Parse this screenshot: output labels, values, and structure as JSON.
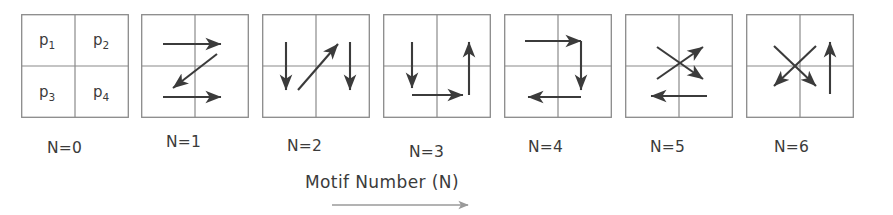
{
  "figure": {
    "caption": "Motif  Number (N)",
    "caption_arrow_icon": "right-arrow-icon",
    "background_color": "#ffffff",
    "ink_color": "#3b3b3b",
    "grid_line_color": "#8a8a8a",
    "caption_arrow_color": "#9a9a9a"
  },
  "motifs": [
    {
      "label": "N=0",
      "x": 21,
      "label_x": 47,
      "label_y": 9,
      "type": "quadrant-labels",
      "quadrant_labels": [
        {
          "base": "p",
          "sub": "1"
        },
        {
          "base": "p",
          "sub": "2"
        },
        {
          "base": "p",
          "sub": "3"
        },
        {
          "base": "p",
          "sub": "4"
        }
      ],
      "arrows": []
    },
    {
      "label": "N=1",
      "x": 141,
      "label_x": 166,
      "label_y": 3,
      "type": "arrows",
      "arrows": [
        {
          "name": "top-right-arrow",
          "direction": "right",
          "x1": 22,
          "y1": 30,
          "x2": 80,
          "y2": 30
        },
        {
          "name": "diagonal-down-left-arrow",
          "direction": "down-left",
          "x1": 76,
          "y1": 40,
          "x2": 32,
          "y2": 74
        },
        {
          "name": "bottom-right-arrow",
          "direction": "right",
          "x1": 22,
          "y1": 83,
          "x2": 80,
          "y2": 83
        }
      ]
    },
    {
      "label": "N=2",
      "x": 262,
      "label_x": 287,
      "label_y": 7,
      "type": "arrows",
      "arrows": [
        {
          "name": "left-down-arrow",
          "direction": "down",
          "x1": 24,
          "y1": 28,
          "x2": 24,
          "y2": 76
        },
        {
          "name": "diagonal-up-right-arrow",
          "direction": "up-right",
          "x1": 36,
          "y1": 76,
          "x2": 76,
          "y2": 30
        },
        {
          "name": "right-down-arrow",
          "direction": "down",
          "x1": 88,
          "y1": 28,
          "x2": 88,
          "y2": 76
        }
      ]
    },
    {
      "label": "N=3",
      "x": 383,
      "label_x": 409,
      "label_y": 13,
      "type": "arrows",
      "arrows": [
        {
          "name": "left-down-arrow",
          "direction": "down",
          "x1": 29,
          "y1": 28,
          "x2": 29,
          "y2": 74
        },
        {
          "name": "bottom-right-arrow",
          "direction": "right",
          "x1": 29,
          "y1": 81,
          "x2": 80,
          "y2": 81
        },
        {
          "name": "right-up-arrow",
          "direction": "up",
          "x1": 86,
          "y1": 81,
          "x2": 86,
          "y2": 28
        }
      ]
    },
    {
      "label": "N=4",
      "x": 504,
      "label_x": 528,
      "label_y": 8,
      "type": "arrows",
      "arrows": [
        {
          "name": "top-right-arrow",
          "direction": "right",
          "x1": 21,
          "y1": 27,
          "x2": 77,
          "y2": 27
        },
        {
          "name": "right-down-arrow",
          "direction": "down",
          "x1": 77,
          "y1": 27,
          "x2": 77,
          "y2": 76
        },
        {
          "name": "bottom-left-arrow",
          "direction": "left",
          "x1": 77,
          "y1": 83,
          "x2": 24,
          "y2": 83
        }
      ]
    },
    {
      "label": "N=5",
      "x": 625,
      "label_x": 650,
      "label_y": 8,
      "type": "arrows",
      "arrows": [
        {
          "name": "diagonal-up-right-arrow",
          "direction": "up-right",
          "x1": 32,
          "y1": 65,
          "x2": 78,
          "y2": 33
        },
        {
          "name": "diagonal-down-right-arrow",
          "direction": "down-right",
          "x1": 32,
          "y1": 33,
          "x2": 78,
          "y2": 65
        },
        {
          "name": "bottom-left-arrow",
          "direction": "left",
          "x1": 82,
          "y1": 82,
          "x2": 26,
          "y2": 82
        }
      ]
    },
    {
      "label": "N=6",
      "x": 746,
      "label_x": 774,
      "label_y": 8,
      "type": "arrows",
      "arrows": [
        {
          "name": "diagonal-down-right-arrow",
          "direction": "down-right",
          "x1": 28,
          "y1": 32,
          "x2": 70,
          "y2": 72
        },
        {
          "name": "diagonal-down-left-arrow",
          "direction": "down-left",
          "x1": 70,
          "y1": 32,
          "x2": 28,
          "y2": 72
        },
        {
          "name": "right-up-arrow",
          "direction": "up",
          "x1": 84,
          "y1": 80,
          "x2": 84,
          "y2": 28
        }
      ]
    }
  ]
}
